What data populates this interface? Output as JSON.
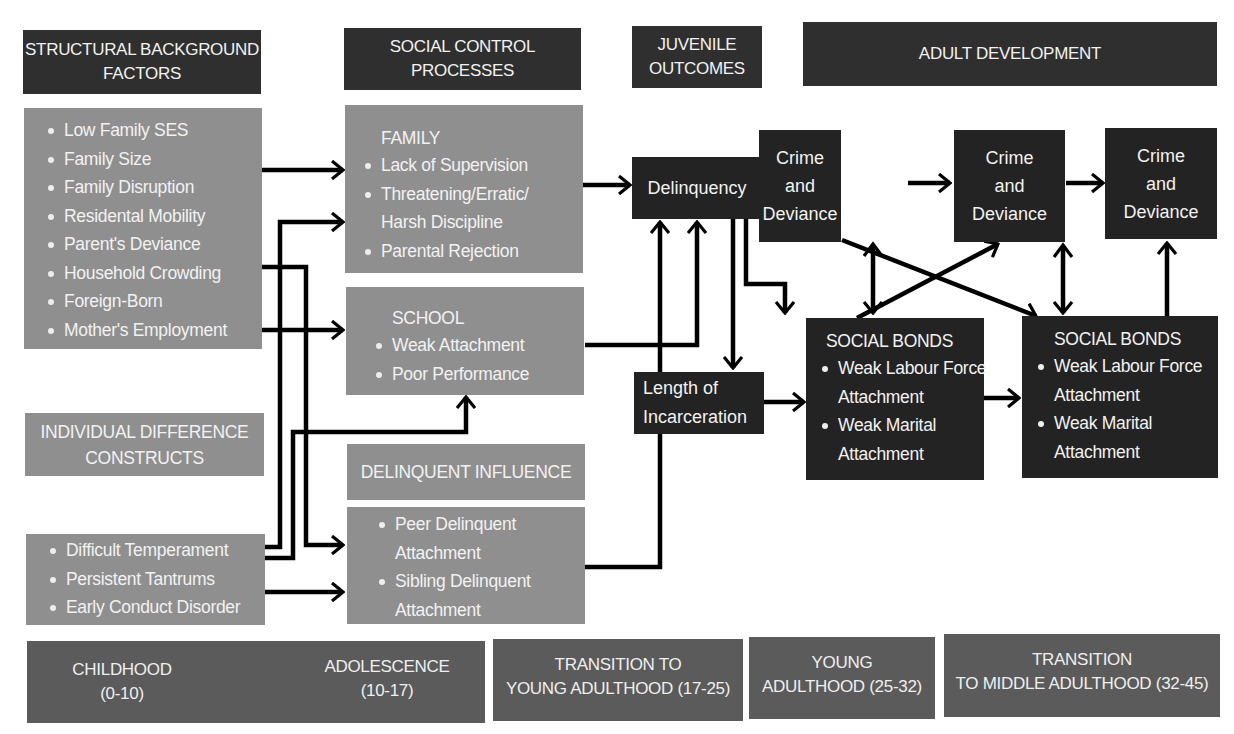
{
  "headers": {
    "structural": [
      "STRUCTURAL BACKGROUND",
      "FACTORS"
    ],
    "social_control": [
      "SOCIAL CONTROL",
      "PROCESSES"
    ],
    "juvenile": [
      "JUVENILE",
      "OUTCOMES"
    ],
    "adult": "ADULT DEVELOPMENT"
  },
  "structural_factors": [
    "Low Family SES",
    "Family Size",
    "Family Disruption",
    "Residental Mobility",
    "Parent's Deviance",
    "Household Crowding",
    "Foreign-Born",
    "Mother's Employment"
  ],
  "individual_difference": {
    "title": [
      "INDIVIDUAL DIFFERENCE",
      "CONSTRUCTS"
    ],
    "items": [
      "Difficult Temperament",
      "Persistent Tantrums",
      "Early Conduct Disorder"
    ]
  },
  "family": {
    "title": "FAMILY",
    "items": [
      "Lack of Supervision",
      "Threatening/Erratic/ Harsh Discipline",
      "Parental Rejection"
    ]
  },
  "school": {
    "title": "SCHOOL",
    "items": [
      "Weak Attachment",
      "Poor Performance"
    ]
  },
  "delinquent_influence": {
    "title": "DELINQUENT INFLUENCE",
    "items": [
      "Peer Delinquent Attachment",
      "Sibling Delinquent Attachment"
    ]
  },
  "delinquency": "Delinquency",
  "incarceration": [
    "Length of",
    "Incarceration"
  ],
  "crime": [
    [
      "Crime",
      "and",
      "Deviance"
    ],
    [
      "Crime",
      "and",
      "Deviance"
    ],
    [
      "Crime",
      "and",
      "Deviance"
    ]
  ],
  "social_bonds": [
    {
      "title": "SOCIAL BONDS",
      "items": [
        "Weak Labour Force Attachment",
        "Weak Marital Attachment"
      ]
    },
    {
      "title": "SOCIAL BONDS",
      "items": [
        "Weak Labour Force Attachment",
        "Weak Marital Attachment"
      ]
    }
  ],
  "timeline": {
    "childhood": [
      "CHILDHOOD",
      "(0-10)"
    ],
    "adolescence": [
      "ADOLESCENCE",
      "(10-17)"
    ],
    "transition_young": [
      "TRANSITION TO",
      "YOUNG ADULTHOOD (17-25)"
    ],
    "young_adulthood": [
      "YOUNG",
      "ADULTHOOD (25-32)"
    ],
    "transition_middle": [
      "TRANSITION",
      "TO MIDDLE ADULTHOOD (32-45)"
    ]
  },
  "colors": {
    "header_dark": "#2f2f2f",
    "content_gray": "#8f8f8f",
    "outcome_dark": "#232323",
    "timeline_gray": "#5b5b5b",
    "arrow": "#000000"
  }
}
